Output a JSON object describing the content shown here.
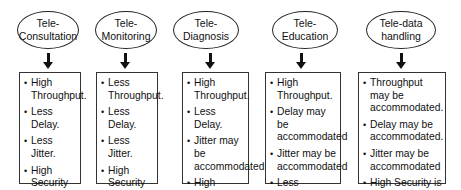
{
  "diagram": {
    "columns": [
      {
        "title": "Tele-\nConsultation",
        "items": [
          "High Throughput.",
          "Less Delay.",
          "Less Jitter.",
          "High Security due to sensitive context."
        ]
      },
      {
        "title": "Tele-\nMonitoring",
        "items": [
          "Less Throughput.",
          "Less Delay.",
          "Less Jitter.",
          "High Security due to sensitive context."
        ]
      },
      {
        "title": "Tele-\nDiagnosis",
        "items": [
          "High Throughput.",
          "Less Delay.",
          "Jitter may be accommodated",
          "High Security due to sensitive context."
        ]
      },
      {
        "title": "Tele-\nEducation",
        "items": [
          "High Throughput.",
          "Delay may be accommodated",
          "Jitter may be accommodated",
          "Less Security is required."
        ]
      },
      {
        "title": "Tele-data\nhandling",
        "items": [
          "Throughput may be accommodated.",
          "Delay may be accommodated.",
          "Jitter may be accommodated",
          "High Security is required."
        ]
      }
    ]
  }
}
